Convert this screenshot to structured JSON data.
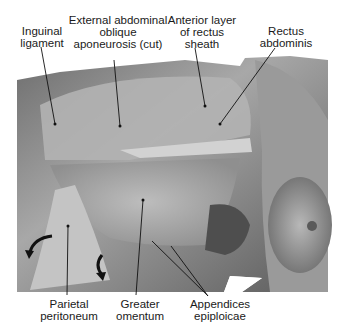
{
  "figure": {
    "type": "anatomical photograph (dissection, grayscale)",
    "labels": {
      "inguinal_ligament": "Inguinal\nligament",
      "external_oblique": "External abdominal\noblique\naponeurosis (cut)",
      "anterior_rectus_sheath": "Anterior layer\nof rectus\nsheath",
      "rectus_abdominis": "Rectus\nabdominis",
      "parietal_peritoneum": "Parietal\nperitoneum",
      "greater_omentum": "Greater\nomentum",
      "appendices_epiploicae": "Appendices\nepiploicae"
    },
    "colors": {
      "background": "#ffffff",
      "text": "#1a1a1a",
      "leader_line": "#111111"
    }
  }
}
